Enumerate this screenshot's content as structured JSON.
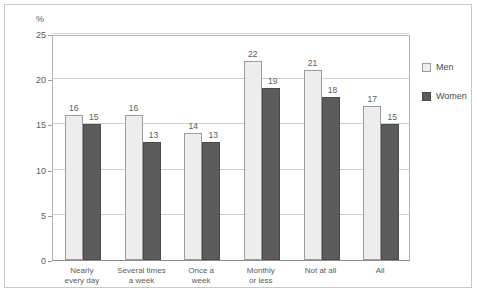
{
  "chart_data": {
    "type": "bar",
    "title": "",
    "xlabel": "",
    "ylabel": "%",
    "ylim": [
      0,
      25
    ],
    "yticks": [
      0,
      5,
      10,
      15,
      20,
      25
    ],
    "ytick_labels": [
      "0",
      "5",
      "10",
      "15",
      "20",
      "25"
    ],
    "grid": true,
    "legend_position": "right",
    "categories": [
      "Nearly every day",
      "Several times a week",
      "Once a week",
      "Monthly or less",
      "Not at all",
      "All"
    ],
    "category_lines": [
      [
        "Nearly",
        "every day"
      ],
      [
        "Several times",
        "a week"
      ],
      [
        "Once a",
        "week"
      ],
      [
        "Monthly",
        "or less"
      ],
      [
        "Not at all",
        ""
      ],
      [
        "All",
        ""
      ]
    ],
    "series": [
      {
        "name": "Men",
        "color": "#ededed",
        "values": [
          16,
          16,
          14,
          22,
          21,
          17
        ]
      },
      {
        "name": "Women",
        "color": "#5c5c5c",
        "values": [
          15,
          13,
          13,
          19,
          18,
          15
        ]
      }
    ]
  },
  "legend": {
    "items": [
      {
        "label": "Men",
        "swatch": "men"
      },
      {
        "label": "Women",
        "swatch": "women"
      }
    ]
  },
  "colors": {
    "men_fill": "#ededed",
    "women_fill": "#5c5c5c",
    "grid": "#cfcfcf",
    "axis": "#b4b4b4",
    "text": "#5b5b5b",
    "frame": "#c9c9c9"
  }
}
